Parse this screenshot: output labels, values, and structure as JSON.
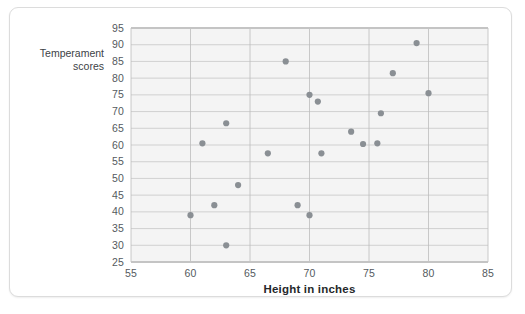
{
  "chart_data": {
    "type": "scatter",
    "title": "",
    "xlabel": "Height in inches",
    "ylabel": "Temperament scores",
    "ylabel_line1": "Temperament",
    "ylabel_line2": "scores",
    "xlim": [
      55,
      85
    ],
    "ylim": [
      25,
      95
    ],
    "xticks": [
      55,
      60,
      65,
      70,
      75,
      80,
      85
    ],
    "yticks": [
      25,
      30,
      35,
      40,
      45,
      50,
      55,
      60,
      65,
      70,
      75,
      80,
      85,
      90,
      95
    ],
    "grid": "both",
    "legend": "none",
    "marker_color": "#8a8f94",
    "plot_background": "#f4f4f4",
    "points": [
      {
        "x": 60.0,
        "y": 39.0
      },
      {
        "x": 61.0,
        "y": 60.5
      },
      {
        "x": 62.0,
        "y": 42.0
      },
      {
        "x": 63.0,
        "y": 30.0
      },
      {
        "x": 63.0,
        "y": 66.5
      },
      {
        "x": 64.0,
        "y": 48.0
      },
      {
        "x": 66.5,
        "y": 57.5
      },
      {
        "x": 68.0,
        "y": 85.0
      },
      {
        "x": 69.0,
        "y": 42.0
      },
      {
        "x": 70.0,
        "y": 39.0
      },
      {
        "x": 70.0,
        "y": 75.0
      },
      {
        "x": 70.7,
        "y": 73.0
      },
      {
        "x": 71.0,
        "y": 57.5
      },
      {
        "x": 73.5,
        "y": 64.0
      },
      {
        "x": 74.5,
        "y": 60.3
      },
      {
        "x": 75.7,
        "y": 60.5
      },
      {
        "x": 76.0,
        "y": 69.5
      },
      {
        "x": 77.0,
        "y": 81.5
      },
      {
        "x": 79.0,
        "y": 90.5
      },
      {
        "x": 80.0,
        "y": 75.5
      }
    ]
  }
}
